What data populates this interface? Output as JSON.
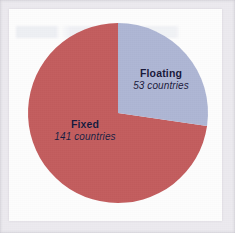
{
  "figure": {
    "panel_background": "#fdfdfd",
    "frame_color": "#eceaef"
  },
  "chart_data": {
    "type": "pie",
    "title": "",
    "subtitle": "",
    "xlabel": "",
    "ylabel": "",
    "unit": "countries",
    "total": 194,
    "legend_position": "inside-slices",
    "grid": false,
    "start_angle_deg": 0,
    "direction": "clockwise",
    "categories": [
      "Floating",
      "Fixed"
    ],
    "values": [
      53,
      141
    ],
    "colors": [
      "#aeb6d4",
      "#c35d5e"
    ],
    "slices": [
      {
        "label": "Floating",
        "value": 53,
        "value_text": "53 countries",
        "color": "#aeb6d4",
        "percent": 27.3,
        "angle_deg": 98.4
      },
      {
        "label": "Fixed",
        "value": 141,
        "value_text": "141 countries",
        "color": "#c35d5e",
        "percent": 72.7,
        "angle_deg": 261.6
      }
    ]
  },
  "labels": {
    "floating": {
      "title": "Floating",
      "value_text": "53 countries"
    },
    "fixed": {
      "title": "Fixed",
      "value_text": "141 countries"
    }
  }
}
